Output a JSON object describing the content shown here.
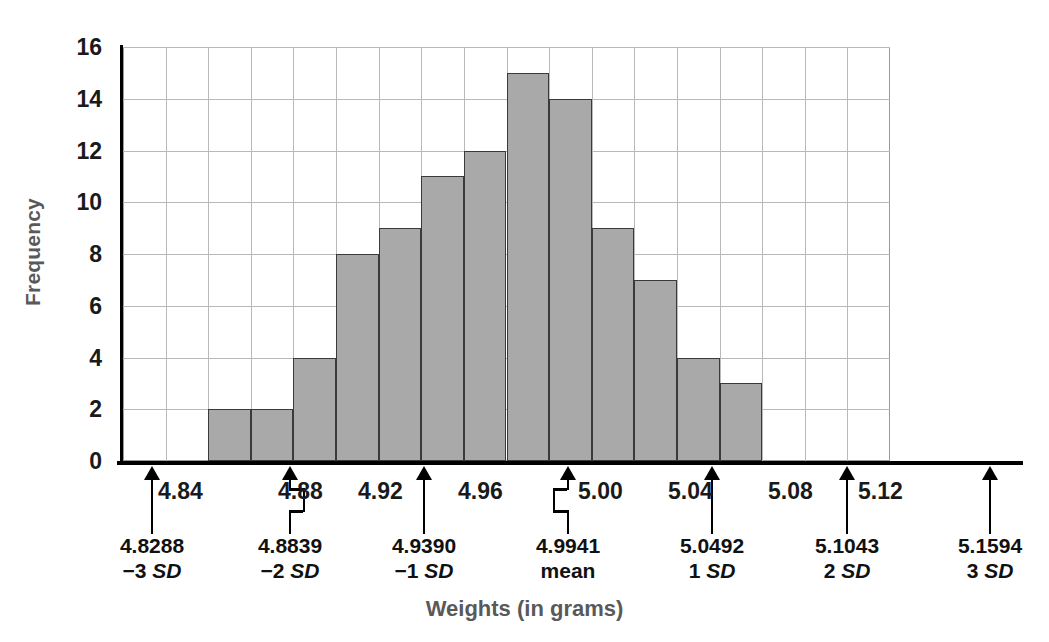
{
  "chart_data": {
    "type": "bar",
    "title": "",
    "xlabel": "Weights (in grams)",
    "ylabel": "Frequency",
    "ylim": [
      0,
      16
    ],
    "ytick_step": 2,
    "yticks": [
      16,
      14,
      12,
      10,
      8,
      6,
      4,
      2,
      0
    ],
    "grid": true,
    "legend": "none",
    "bin_count": 18,
    "bin_width": 0.0184,
    "categories": [
      "bin-1",
      "bin-2",
      "bin-3",
      "bin-4",
      "bin-5",
      "bin-6",
      "bin-7",
      "bin-8",
      "bin-9",
      "bin-10",
      "bin-11",
      "bin-12",
      "bin-13",
      "bin-14",
      "bin-15",
      "bin-16",
      "bin-17",
      "bin-18"
    ],
    "values": [
      0,
      0,
      2,
      2,
      4,
      8,
      9,
      11,
      12,
      15,
      14,
      9,
      7,
      4,
      3,
      0,
      0,
      0
    ],
    "xticks": [
      "4.84",
      "4.88",
      "4.92",
      "4.96",
      "5.00",
      "5.04",
      "5.08",
      "5.12"
    ],
    "annotations": [
      {
        "value": "4.8288",
        "label": "−3 SD",
        "sd": "-3"
      },
      {
        "value": "4.8839",
        "label": "−2 SD",
        "sd": "-2"
      },
      {
        "value": "4.9390",
        "label": "−1 SD",
        "sd": "-1"
      },
      {
        "value": "4.9941",
        "label": "mean",
        "sd": "0"
      },
      {
        "value": "5.0492",
        "label": "1 SD",
        "sd": "1"
      },
      {
        "value": "5.1043",
        "label": "2 SD",
        "sd": "2"
      },
      {
        "value": "5.1594",
        "label": "3 SD",
        "sd": "3"
      }
    ]
  },
  "axes": {
    "y_title": "Frequency",
    "x_title": "Weights (in grams)",
    "y_tick_labels": [
      "16",
      "14",
      "12",
      "10",
      "8",
      "6",
      "4",
      "2",
      "0"
    ],
    "x_tick_labels": [
      "4.84",
      "4.88",
      "4.92",
      "4.96",
      "5.00",
      "5.04",
      "5.08",
      "5.12"
    ]
  },
  "sd_annotations": [
    {
      "value": "4.8288",
      "label_prefix": "−3",
      "label_unit": "SD"
    },
    {
      "value": "4.8839",
      "label_prefix": "−2",
      "label_unit": "SD"
    },
    {
      "value": "4.9390",
      "label_prefix": "−1",
      "label_unit": "SD"
    },
    {
      "value": "4.9941",
      "label_prefix": "mean",
      "label_unit": ""
    },
    {
      "value": "5.0492",
      "label_prefix": "1",
      "label_unit": "SD"
    },
    {
      "value": "5.1043",
      "label_prefix": "2",
      "label_unit": "SD"
    },
    {
      "value": "5.1594",
      "label_prefix": "3",
      "label_unit": "SD"
    }
  ],
  "colors": {
    "bar_fill": "#a9a9a9",
    "bar_border": "#3a3a3a",
    "grid": "#b9b9b9",
    "axis": "#000000",
    "title_text": "#595959",
    "tick_text": "#1a1a1a"
  }
}
